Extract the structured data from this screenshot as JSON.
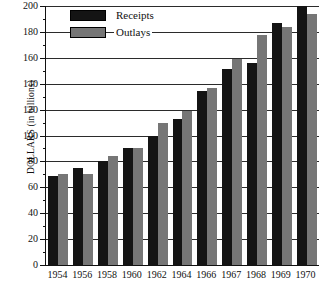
{
  "chart_data": {
    "type": "bar",
    "title": "",
    "xlabel": "",
    "ylabel": "DOLLARS (in billions)",
    "ylim": [
      0,
      200
    ],
    "ytick_step": 20,
    "yminor_step": 10,
    "grid": true,
    "legend_position": "top-left-inside",
    "categories": [
      "1954",
      "1956",
      "1958",
      "1960",
      "1962",
      "1964",
      "1966",
      "1967",
      "1968",
      "1969",
      "1970"
    ],
    "series": [
      {
        "name": "Receipts",
        "color": "#141414",
        "values": [
          69,
          75,
          80,
          90,
          100,
          113,
          134,
          151,
          156,
          187,
          200
        ]
      },
      {
        "name": "Outlays",
        "color": "#767676",
        "values": [
          70,
          70,
          84,
          90,
          110,
          119,
          137,
          159,
          178,
          184,
          194
        ]
      }
    ],
    "ytick_labels": [
      "0",
      "20",
      "40",
      "60",
      "80",
      "100",
      "120",
      "140",
      "160",
      "180",
      "200"
    ]
  },
  "axis": {
    "y_title_caps": "DOLLARS",
    "y_title_rest": " (in billions)"
  }
}
